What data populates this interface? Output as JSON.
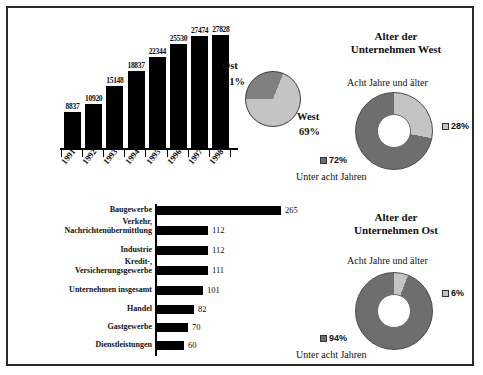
{
  "chart_data": [
    {
      "type": "bar",
      "title": "",
      "orientation": "vertical",
      "categories": [
        "1991",
        "1992",
        "1993",
        "1994",
        "1995",
        "1996",
        "1997",
        "1998"
      ],
      "values": [
        8837,
        10920,
        15148,
        18837,
        22344,
        25530,
        27474,
        27828
      ],
      "xlabel": "",
      "ylabel": "",
      "ylim": [
        0,
        29000
      ],
      "grid": false,
      "legend": "none",
      "bar_color": "#000000"
    },
    {
      "type": "pie",
      "title": "",
      "labels": [
        "Ost",
        "West"
      ],
      "values": [
        31,
        69
      ],
      "value_suffix": "%",
      "colors": [
        "#808080",
        "#c4c4c4"
      ],
      "legend": "labels placed outside slices"
    },
    {
      "type": "pie",
      "title": "Alter der Unternehmen West",
      "subtype": "donut",
      "labels": [
        "Acht Jahre und älter",
        "Unter acht Jahren"
      ],
      "values": [
        28,
        72
      ],
      "value_suffix": "%",
      "colors": [
        "#c4c4c4",
        "#6e6e6e"
      ],
      "legend": "right and left of donut"
    },
    {
      "type": "pie",
      "title": "Alter der Unternehmen Ost",
      "subtype": "donut",
      "labels": [
        "Acht Jahre und älter",
        "Unter acht Jahren"
      ],
      "values": [
        6,
        94
      ],
      "value_suffix": "%",
      "colors": [
        "#c4c4c4",
        "#6e6e6e"
      ],
      "legend": "right and left of donut"
    },
    {
      "type": "bar",
      "orientation": "horizontal",
      "title": "",
      "categories": [
        "Baugewerbe",
        "Verkehr,\nNachrichtenübermittlung",
        "Industrie",
        "Kredit-,\nVersicherungsgewerbe",
        "Unternehmen insgesamt",
        "Handel",
        "Gastgewerbe",
        "Dienstleistungen"
      ],
      "values": [
        265,
        112,
        112,
        111,
        101,
        82,
        70,
        60
      ],
      "xlabel": "",
      "ylabel": "",
      "xlim": [
        0,
        280
      ],
      "grid": false,
      "legend": "none",
      "bar_color": "#000000"
    }
  ],
  "vbar": {
    "years": [
      "1991",
      "1992",
      "1993",
      "1994",
      "1995",
      "1996",
      "1997",
      "1998"
    ],
    "values": [
      "8837",
      "10920",
      "15148",
      "18837",
      "22344",
      "25530",
      "27474",
      "27828"
    ]
  },
  "pie_ow": {
    "ost_label": "Ost",
    "ost_value": "31%",
    "west_label": "West",
    "west_value": "69%"
  },
  "donut_west": {
    "title_line1": "Alter der",
    "title_line2": "Unternehmen West",
    "caption_top": "Acht Jahre und älter",
    "caption_bottom": "Unter acht Jahren",
    "value_older": "28%",
    "value_younger": "72%"
  },
  "donut_ost": {
    "title_line1": "Alter der",
    "title_line2": "Unternehmen Ost",
    "caption_top": "Acht Jahre und älter",
    "caption_bottom": "Unter acht Jahren",
    "value_older": "6%",
    "value_younger": "94%"
  },
  "hbar": {
    "labels": [
      "Baugewerbe",
      "Verkehr,",
      "Nachrichtenübermittlung",
      "Industrie",
      "Kredit-,",
      "Versicherungsgewerbe",
      "Unternehmen insgesamt",
      "Handel",
      "Gastgewerbe",
      "Dienstleistungen"
    ],
    "values": [
      "265",
      "112",
      "112",
      "111",
      "101",
      "82",
      "70",
      "60"
    ]
  },
  "colors": {
    "bar": "#000000",
    "pie_dark": "#808080",
    "pie_light": "#c4c4c4",
    "donut_dark": "#6e6e6e",
    "donut_light": "#c4c4c4",
    "frame": "#2b2b2b"
  }
}
